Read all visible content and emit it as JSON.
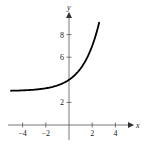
{
  "chart_data": {
    "type": "line",
    "title": "",
    "xlabel": "x",
    "ylabel": "y",
    "xlim": [
      -5,
      5.5
    ],
    "ylim": [
      -1,
      10
    ],
    "grid": false,
    "legend": null,
    "x_ticks": [
      -4,
      -2,
      2,
      4
    ],
    "x_tick_labels": [
      "−4",
      "−2",
      "2",
      "4"
    ],
    "y_ticks": [
      2,
      6,
      8
    ],
    "y_tick_labels": [
      "2",
      "6",
      "8"
    ],
    "series": [
      {
        "name": "f(x) = 2^x + 3",
        "x": [
          -5,
          -4,
          -3,
          -2,
          -1,
          0,
          0.5,
          1,
          1.5,
          2,
          2.3,
          2.6
        ],
        "values": [
          3.03,
          3.06,
          3.13,
          3.25,
          3.5,
          4.0,
          4.41,
          5.0,
          5.83,
          7.0,
          7.92,
          9.06
        ]
      }
    ],
    "asymptote": {
      "y": 3,
      "drawn": false
    },
    "color": "#000000"
  },
  "axes": {
    "x_label": "x",
    "y_label": "y"
  }
}
